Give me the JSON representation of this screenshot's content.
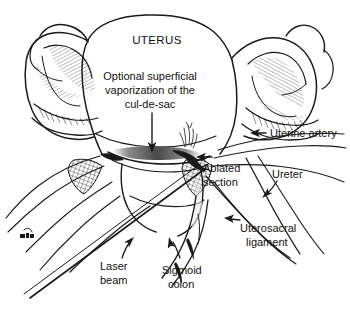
{
  "figure": {
    "title_label": "UTERUS",
    "caption_lines": [
      "Optional superficial",
      "vaporization of the",
      "cul-de-sac"
    ],
    "caption_line_1": "Optional superficial",
    "caption_line_2": "vaporization of the",
    "caption_line_3": "cul-de-sac",
    "artist_signature": "",
    "background_color": "#ffffff",
    "ink_color": "#1a1a1a",
    "shading_color": "#6e6e6e"
  },
  "annotations": [
    {
      "id": "uterine-artery",
      "label": "Uterine artery",
      "lines": [
        "Uterine artery"
      ],
      "arrow": "left-pointing"
    },
    {
      "id": "ureter",
      "label": "Ureter",
      "lines": [
        "Ureter"
      ],
      "arrow": "down-left-hook"
    },
    {
      "id": "ablated-section",
      "label": "Ablated section",
      "lines": [
        "Ablated",
        "section"
      ],
      "arrow": "left-pointing"
    },
    {
      "id": "uterosacral-ligament",
      "label": "Uterosacral ligament",
      "lines": [
        "Uterosacral",
        "ligament"
      ],
      "arrow": "left-pointing"
    },
    {
      "id": "laser-beam",
      "label": "Laser beam",
      "lines": [
        "Laser",
        "beam"
      ],
      "arrow": "up-right-hook"
    },
    {
      "id": "sigmoid-colon",
      "label": "Sigmoid colon",
      "lines": [
        "Sigmoid",
        "colon"
      ],
      "arrow": "up-left-hook"
    }
  ],
  "annotation_text": {
    "uterine_artery": "Uterine artery",
    "ureter": "Ureter",
    "ablated_line1": "Ablated",
    "ablated_line2": "section",
    "uterosacral_line1": "Uterosacral",
    "uterosacral_line2": "ligament",
    "laser_line1": "Laser",
    "laser_line2": "beam",
    "sigmoid_line1": "Sigmoid",
    "sigmoid_line2": "colon"
  }
}
